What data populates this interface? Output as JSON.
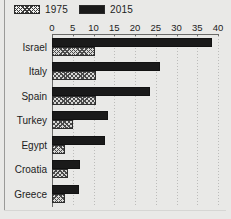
{
  "chart_data": {
    "type": "bar",
    "orientation": "horizontal",
    "title": "",
    "xlabel": "",
    "ylabel": "",
    "categories": [
      "Israel",
      "Italy",
      "Spain",
      "Turkey",
      "Egypt",
      "Croatia",
      "Greece"
    ],
    "series": [
      {
        "name": "1975",
        "pattern": "hatched",
        "values": [
          10.4,
          10.5,
          10.5,
          5.0,
          3.1,
          3.9,
          3.2
        ]
      },
      {
        "name": "2015",
        "pattern": "solid",
        "values": [
          38.5,
          26.0,
          23.6,
          13.5,
          12.8,
          6.8,
          6.5
        ]
      }
    ],
    "xlim": [
      0,
      40
    ],
    "xticks": [
      0,
      5,
      10,
      15,
      20,
      25,
      30,
      35,
      40
    ],
    "xtick_labels": [
      "0",
      "5",
      "10",
      "15",
      "20",
      "25",
      "30",
      "35",
      "40"
    ],
    "grid": true,
    "grid_axis": "x",
    "legend_position": "top-left",
    "colors": {
      "series_2015": "#1a1a1a",
      "series_1975_fill": "#d8d8d6",
      "series_1975_hatch": "#4a4a4a",
      "background": "#e9e9e7",
      "axis": "#6a6a68",
      "gridline": "#bcbcba",
      "text": "#1c1c1c"
    }
  },
  "legend": {
    "items": [
      {
        "label": "1975",
        "swatch": "hatched-swatch"
      },
      {
        "label": "2015",
        "swatch": "solid-swatch"
      }
    ]
  }
}
